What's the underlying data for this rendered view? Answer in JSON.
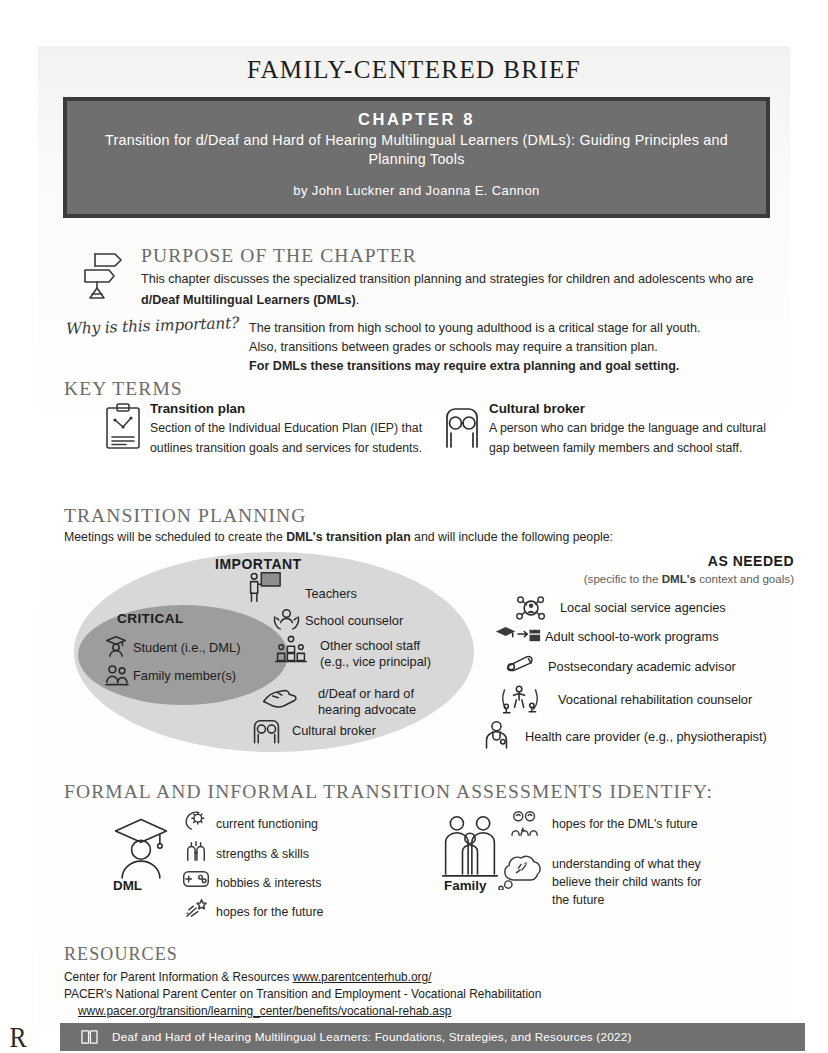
{
  "document": {
    "brief_title": "FAMILY-CENTERED BRIEF"
  },
  "banner": {
    "chapter_number": "CHAPTER 8",
    "chapter_title": "Transition for d/Deaf and Hard of Hearing Multilingual Learners (DMLs): Guiding Principles and Planning Tools",
    "authors": "by John Luckner and Joanna E. Cannon",
    "bg_color": "#6f6f6f",
    "border_color": "#3b3b3b"
  },
  "purpose": {
    "heading": "PURPOSE OF THE CHAPTER",
    "body_lead": "This chapter discusses the specialized transition planning and strategies for children and adolescents who are ",
    "body_bold": "d/Deaf Multilingual Learners (DMLs)",
    "body_tail": ".",
    "icon": "signpost-icon"
  },
  "why_important": {
    "script_label": "Why is this important?",
    "line1": "The transition from high school to young adulthood is a critical stage for all youth.",
    "line2": "Also, transitions between grades or schools may require a transition plan.",
    "line3_bold": "For DMLs these transitions may require extra planning and goal setting."
  },
  "key_terms": {
    "heading": "KEY TERMS",
    "items": [
      {
        "title": "Transition plan",
        "body": "Section of the Individual Education Plan (IEP) that outlines transition goals and services for students.",
        "icon": "clipboard-icon"
      },
      {
        "title": "Cultural broker",
        "body": "A person who can bridge the language and cultural gap between family members and school staff.",
        "icon": "cultural-broker-icon"
      }
    ]
  },
  "transition_planning": {
    "heading": "TRANSITION PLANNING",
    "subtitle_lead": "Meetings will be scheduled to create the ",
    "subtitle_bold1": "DML's transition plan",
    "subtitle_tail": " and will include the following people:",
    "critical_label": "CRITICAL",
    "important_label": "IMPORTANT",
    "as_needed_label": "AS NEEDED",
    "as_needed_sub_lead": "(specific to the ",
    "as_needed_sub_bold": "DML's",
    "as_needed_sub_tail": " context and goals)",
    "critical_items": [
      {
        "label": "Student (i.e., DML)",
        "icon": "graduate-icon"
      },
      {
        "label": "Family member(s)",
        "icon": "family-pair-icon"
      }
    ],
    "important_items": [
      {
        "label": "Teachers",
        "icon": "teacher-board-icon"
      },
      {
        "label": "School counselor",
        "icon": "counselor-hands-icon"
      },
      {
        "label": "Other school staff\n(e.g., vice principal)",
        "line1": "Other school staff",
        "line2": "(e.g., vice principal)",
        "icon": "school-staff-icon"
      },
      {
        "line1": "d/Deaf or hard of",
        "line2": "hearing advocate",
        "icon": "signing-hands-icon"
      },
      {
        "label": "Cultural broker",
        "icon": "cultural-broker-icon"
      }
    ],
    "as_needed_items": [
      {
        "label": "Local social service agencies",
        "icon": "network-person-icon"
      },
      {
        "label": "Adult school-to-work programs",
        "icon": "cap-to-briefcase-icon"
      },
      {
        "label": "Postsecondary academic advisor",
        "icon": "diploma-scroll-icon"
      },
      {
        "label": "Vocational rehabilitation counselor",
        "icon": "rehab-counselor-icon"
      },
      {
        "label": "Health care provider (e.g., physiotherapist)",
        "icon": "health-provider-icon"
      }
    ],
    "oval_outer_color": "#d8d8d8",
    "oval_inner_color": "#9d9d9d"
  },
  "assessments": {
    "heading": "FORMAL AND INFORMAL TRANSITION ASSESSMENTS IDENTIFY:",
    "columns": [
      {
        "label": "DML",
        "icon": "graduate-large-icon",
        "items": [
          {
            "text": "current functioning",
            "icon": "head-gear-icon"
          },
          {
            "text": "strengths & skills",
            "icon": "muscle-arm-icon"
          },
          {
            "text": "hobbies & interests",
            "icon": "game-controller-icon"
          },
          {
            "text": "hopes for the future",
            "icon": "shooting-star-icon"
          }
        ]
      },
      {
        "label": "Family",
        "icon": "family-group-icon",
        "items": [
          {
            "text": "hopes for the DML's future",
            "icon": "family-hopes-icon"
          },
          {
            "line1": "understanding of what they",
            "line2": "believe their child wants for",
            "line3": "the future",
            "icon": "thought-cloud-icon"
          }
        ]
      }
    ]
  },
  "resources": {
    "heading": "RESOURCES",
    "line1_text": "Center for Parent Information & Resources",
    "line1_link": "www.parentcenterhub.org/",
    "line2_text": "PACER's National Parent Center on Transition and Employment - Vocational Rehabilitation",
    "line3_link": "www.pacer.org/transition/learning_center/benefits/vocational-rehab.asp"
  },
  "footer": {
    "text": "Deaf and Hard of Hearing Multilingual Learners: Foundations, Strategies, and Resources (2022)",
    "icon": "open-book-icon",
    "bg_color": "#707070",
    "corner_mark": "R"
  }
}
